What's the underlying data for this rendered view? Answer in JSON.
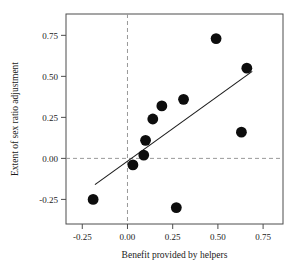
{
  "chart_data": {
    "type": "scatter",
    "title": "",
    "xlabel": "Benefit provided by helpers",
    "ylabel": "Extent of sex ratio adjustment",
    "xlim": [
      -0.34,
      0.86
    ],
    "ylim": [
      -0.4,
      0.88
    ],
    "xticks": [
      -0.25,
      0.0,
      0.25,
      0.5,
      0.75
    ],
    "xticklabels": [
      "-0.25",
      "0.00",
      "0.25",
      "0.50",
      "0.75"
    ],
    "yticks": [
      -0.25,
      0.0,
      0.25,
      0.5,
      0.75
    ],
    "yticklabels": [
      "-0.25",
      "0.00",
      "0.25",
      "0.50",
      "0.75"
    ],
    "grid": false,
    "legend": null,
    "reference_lines": [
      {
        "orientation": "vertical",
        "value": 0.0,
        "style": "dashed",
        "color": "#999999"
      },
      {
        "orientation": "horizontal",
        "value": 0.0,
        "style": "dashed",
        "color": "#999999"
      }
    ],
    "points": [
      {
        "x": -0.19,
        "y": -0.25
      },
      {
        "x": 0.03,
        "y": -0.04
      },
      {
        "x": 0.09,
        "y": 0.02
      },
      {
        "x": 0.1,
        "y": 0.11
      },
      {
        "x": 0.14,
        "y": 0.24
      },
      {
        "x": 0.19,
        "y": 0.32
      },
      {
        "x": 0.27,
        "y": -0.3
      },
      {
        "x": 0.31,
        "y": 0.36
      },
      {
        "x": 0.49,
        "y": 0.73
      },
      {
        "x": 0.63,
        "y": 0.16
      },
      {
        "x": 0.66,
        "y": 0.55
      }
    ],
    "fit_line": {
      "type": "linear-regression",
      "x_start": -0.18,
      "y_start": -0.16,
      "x_end": 0.69,
      "y_end": 0.53,
      "color": "#1a1a1a"
    },
    "marker": {
      "shape": "circle",
      "color": "#0d0d0d",
      "size": 5.4
    },
    "colors": {
      "axis": "#4d4d4d",
      "text": "#1a1a1a",
      "dash": "#9a9a9a",
      "marker": "#0d0d0d"
    }
  }
}
